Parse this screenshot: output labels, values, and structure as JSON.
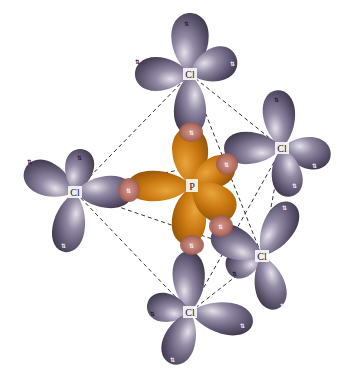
{
  "diagram": {
    "title": "",
    "molecule": "PCl5",
    "geometry": "trigonal bipyramidal",
    "central_atom": {
      "label": "P",
      "x": 192,
      "y": 186
    },
    "ligands": [
      {
        "id": "cl-top",
        "label": "Cl",
        "x": 190,
        "y": 74
      },
      {
        "id": "cl-upper-right",
        "label": "Cl",
        "x": 282,
        "y": 148
      },
      {
        "id": "cl-left",
        "label": "Cl",
        "x": 75,
        "y": 192
      },
      {
        "id": "cl-lower-right",
        "label": "Cl",
        "x": 262,
        "y": 256
      },
      {
        "id": "cl-bottom",
        "label": "Cl",
        "x": 190,
        "y": 312
      }
    ],
    "electron_pair_symbol": "⇅",
    "colors": {
      "chlorine_lobe": "#6e6680",
      "chlorine_lobe_highlight": "#d9d4e2",
      "chlorine_lobe_shadow": "#4a4258",
      "phosphorus_lobe": "#c8780f",
      "phosphorus_lobe_highlight": "#e7a53a",
      "phosphorus_lobe_shadow": "#9a5608",
      "overlap": "#c07a6c",
      "bond_line": "#333333",
      "background": "#ffffff"
    }
  }
}
